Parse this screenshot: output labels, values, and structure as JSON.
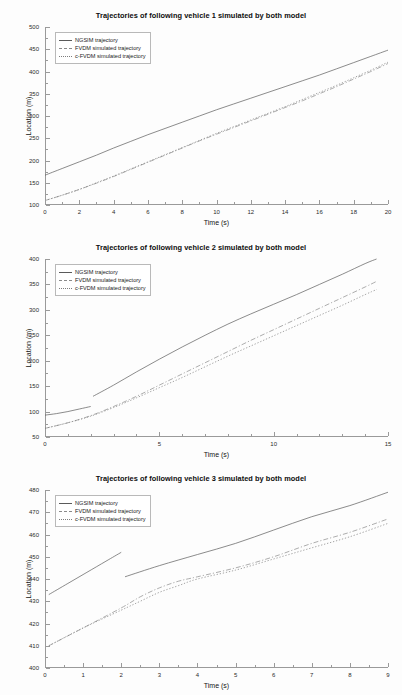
{
  "document": {
    "kind": "figure-page",
    "background": "#fdfdfd",
    "figure_count": 3
  },
  "legend_entries": [
    {
      "label": "NGSIM trajectory",
      "style": "solid",
      "color": "#5a5a5a",
      "icon": "line-swatch-icon"
    },
    {
      "label": "FVDM simulated trajectory",
      "style": "dash-dot",
      "color": "#8a8a8a",
      "icon": "line-swatch-icon"
    },
    {
      "label": "c-FVDM simulated trajectory",
      "style": "dotted",
      "color": "#7d7d7d",
      "icon": "line-swatch-icon"
    }
  ],
  "figures": [
    {
      "title": "Trajectories of following vehicle 1 simulated by both model",
      "xlabel": "Time (s)",
      "ylabel": "Location (m)"
    },
    {
      "title": "Trajectories of following vehicle 2 simulated by both model",
      "xlabel": "Time (s)",
      "ylabel": "Location (m)"
    },
    {
      "title": "Trajectories of following vehicle 3 simulated by both model",
      "xlabel": "Time (s)",
      "ylabel": "Location (m)"
    }
  ],
  "chart_data": [
    {
      "type": "line",
      "title": "Trajectories of following vehicle 1 simulated by both model",
      "xlabel": "Time (s)",
      "ylabel": "Location (m)",
      "xlim": [
        0,
        20
      ],
      "ylim": [
        100,
        500
      ],
      "xticks": [
        0,
        2,
        4,
        6,
        8,
        10,
        12,
        14,
        16,
        18,
        20
      ],
      "yticks": [
        100,
        150,
        200,
        250,
        300,
        350,
        400,
        450,
        500
      ],
      "grid": false,
      "legend_position": "upper-left",
      "series": [
        {
          "name": "NGSIM trajectory",
          "style": "solid",
          "color": "#5a5a5a",
          "x": [
            0,
            1,
            2,
            3,
            4,
            5,
            6,
            7,
            8,
            9,
            10,
            11,
            12,
            13,
            14,
            15,
            16,
            17,
            18,
            19,
            20
          ],
          "y": [
            167,
            182,
            197,
            212,
            228,
            243,
            258,
            272,
            286,
            300,
            314,
            327,
            340,
            353,
            366,
            379,
            392,
            406,
            420,
            434,
            448
          ]
        },
        {
          "name": "FVDM simulated trajectory",
          "style": "dash-dot",
          "color": "#8a8a8a",
          "x": [
            0,
            1,
            2,
            3,
            4,
            5,
            6,
            7,
            8,
            9,
            10,
            11,
            12,
            13,
            14,
            15,
            16,
            17,
            18,
            19,
            20
          ],
          "y": [
            110,
            122,
            135,
            149,
            164,
            180,
            196,
            212,
            228,
            244,
            259,
            274,
            289,
            304,
            319,
            334,
            350,
            366,
            383,
            400,
            418
          ]
        },
        {
          "name": "c-FVDM simulated trajectory",
          "style": "dotted",
          "color": "#7d7d7d",
          "x": [
            0,
            1,
            2,
            3,
            4,
            5,
            6,
            7,
            8,
            9,
            10,
            11,
            12,
            13,
            14,
            15,
            16,
            17,
            18,
            19,
            20
          ],
          "y": [
            110,
            122,
            135,
            150,
            165,
            181,
            197,
            213,
            229,
            245,
            261,
            276,
            291,
            306,
            321,
            337,
            353,
            369,
            386,
            403,
            421
          ]
        }
      ]
    },
    {
      "type": "line",
      "title": "Trajectories of following vehicle 2 simulated by both model",
      "xlabel": "Time (s)",
      "ylabel": "Location (m)",
      "xlim": [
        0,
        15
      ],
      "ylim": [
        50,
        400
      ],
      "xticks": [
        0,
        5,
        10,
        15
      ],
      "yticks": [
        50,
        100,
        150,
        200,
        250,
        300,
        350,
        400
      ],
      "grid": false,
      "legend_position": "upper-left",
      "series": [
        {
          "name": "NGSIM trajectory (segment 1)",
          "style": "solid",
          "color": "#5a5a5a",
          "x": [
            0,
            0.5,
            1.0,
            1.5,
            2.0
          ],
          "y": [
            93,
            96,
            100,
            105,
            110
          ]
        },
        {
          "name": "NGSIM trajectory (segment 2)",
          "style": "solid",
          "color": "#5a5a5a",
          "x": [
            2.1,
            3,
            4,
            5,
            6,
            7,
            8,
            9,
            10,
            11,
            12,
            13,
            14,
            14.5
          ],
          "y": [
            130,
            152,
            178,
            203,
            227,
            250,
            272,
            292,
            311,
            330,
            350,
            370,
            391,
            400
          ]
        },
        {
          "name": "FVDM simulated trajectory",
          "style": "dash-dot",
          "color": "#8a8a8a",
          "x": [
            0,
            1,
            2,
            3,
            4,
            5,
            6,
            7,
            8,
            9,
            10,
            11,
            12,
            13,
            14,
            14.5
          ],
          "y": [
            67,
            78,
            92,
            110,
            130,
            152,
            174,
            196,
            218,
            240,
            261,
            282,
            303,
            324,
            345,
            356
          ]
        },
        {
          "name": "c-FVDM simulated trajectory",
          "style": "dotted",
          "color": "#7d7d7d",
          "x": [
            0,
            1,
            2,
            3,
            4,
            5,
            6,
            7,
            8,
            9,
            10,
            11,
            12,
            13,
            14,
            14.5
          ],
          "y": [
            67,
            78,
            91,
            108,
            127,
            147,
            167,
            188,
            209,
            229,
            249,
            269,
            289,
            309,
            330,
            340
          ]
        }
      ]
    },
    {
      "type": "line",
      "title": "Trajectories of following vehicle 3 simulated by both model",
      "xlabel": "Time (s)",
      "ylabel": "Location (m)",
      "xlim": [
        0,
        9
      ],
      "ylim": [
        400,
        480
      ],
      "xticks": [
        0,
        1,
        2,
        3,
        4,
        5,
        6,
        7,
        8,
        9
      ],
      "yticks": [
        400,
        410,
        420,
        430,
        440,
        450,
        460,
        470,
        480
      ],
      "grid": false,
      "legend_position": "upper-left",
      "series": [
        {
          "name": "NGSIM trajectory (segment 1)",
          "style": "solid",
          "color": "#5a5a5a",
          "x": [
            0.1,
            0.6,
            1.1,
            1.6,
            2.0
          ],
          "y": [
            433,
            438,
            443,
            448,
            452
          ]
        },
        {
          "name": "NGSIM trajectory (segment 2)",
          "style": "solid",
          "color": "#5a5a5a",
          "x": [
            2.1,
            3,
            4,
            5,
            6,
            7,
            8,
            9
          ],
          "y": [
            441,
            446,
            451,
            456,
            462,
            468,
            473,
            479
          ]
        },
        {
          "name": "FVDM simulated trajectory",
          "style": "dash-dot",
          "color": "#8a8a8a",
          "x": [
            0.1,
            1,
            2,
            2.5,
            3,
            3.5,
            4,
            5,
            6,
            7,
            8,
            9
          ],
          "y": [
            410,
            418,
            427,
            432,
            436,
            439,
            441,
            445,
            450,
            456,
            461,
            467
          ]
        },
        {
          "name": "c-FVDM simulated trajectory",
          "style": "dotted",
          "color": "#7d7d7d",
          "x": [
            0.1,
            1,
            2,
            2.5,
            3,
            3.5,
            4,
            5,
            6,
            7,
            8,
            9
          ],
          "y": [
            410,
            418,
            426,
            430,
            434,
            437,
            440,
            444,
            449,
            454,
            459,
            465
          ]
        }
      ]
    }
  ]
}
